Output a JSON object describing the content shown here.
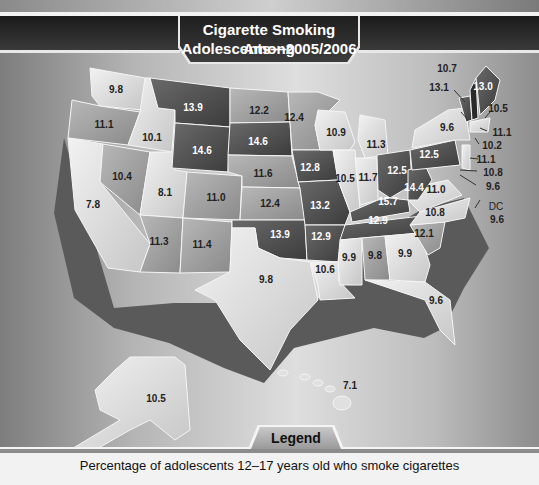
{
  "title": {
    "line1": "Cigarette Smoking Among",
    "line2": "Adolescents—2005/2006"
  },
  "legend": {
    "label": "Legend",
    "caption": "Percentage of adolescents 12–17 years old who smoke cigarettes"
  },
  "states": {
    "WA": "9.8",
    "OR": "11.1",
    "CA": "7.8",
    "ID": "10.1",
    "NV": "10.4",
    "UT": "8.1",
    "AZ": "11.3",
    "MT": "13.9",
    "WY": "14.6",
    "CO": "11.0",
    "NM": "11.4",
    "ND": "12.2",
    "SD": "14.6",
    "NE": "11.6",
    "KS": "12.4",
    "OK": "13.9",
    "TX": "9.8",
    "MN": "12.4",
    "IA": "12.8",
    "MO": "13.2",
    "AR": "12.9",
    "LA": "10.6",
    "WI": "10.9",
    "IL": "10.5",
    "MI": "11.3",
    "IN": "11.7",
    "OH": "12.5",
    "KY": "15.7",
    "TN": "12.9",
    "MS": "9.9",
    "AL": "9.8",
    "GA": "9.9",
    "FL": "9.6",
    "SC": "12.1",
    "NC": "10.8",
    "VA": "11.0",
    "WV": "14.4",
    "PA": "12.5",
    "NY": "9.6",
    "VT": "13.1",
    "NH": "10.7",
    "ME": "13.0",
    "MA": "10.5",
    "RI": "11.1",
    "CT": "10.2",
    "NJ": "11.1",
    "DE": "10.8",
    "MD": "9.6",
    "DC_label": "DC",
    "DC": "9.6",
    "AK": "10.5",
    "HI": "7.1"
  },
  "colors": {
    "highest": "#3a3a3a",
    "high": "#5e5e5e",
    "mid": "#8e8e8e",
    "low": "#c4c4c4",
    "lowest": "#e8e8e8",
    "header": "#1f1f1f"
  }
}
